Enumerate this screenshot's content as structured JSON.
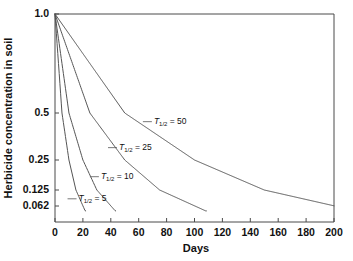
{
  "chart_data": {
    "type": "line",
    "title": "",
    "xlabel": "Days",
    "ylabel": "Herbicide concentration in soil",
    "xlim": [
      0,
      200
    ],
    "ylim": [
      0.0465,
      1.0
    ],
    "yscale": "half-life (power-compressed)",
    "grid": false,
    "legend_position": "inline-annotations",
    "xticks": [
      0,
      20,
      40,
      60,
      80,
      100,
      120,
      140,
      160,
      180,
      200
    ],
    "xtick_labels": [
      "0",
      "20",
      "40",
      "60",
      "80",
      "100",
      "120",
      "140",
      "160",
      "180",
      "200"
    ],
    "yticks": [
      1.0,
      0.5,
      0.25,
      0.125,
      0.062
    ],
    "ytick_labels": [
      "1.0",
      "0.5",
      "0.25",
      "0.125",
      "0.062"
    ],
    "series": [
      {
        "name": "T1/2 = 5",
        "half_life": 5,
        "label_prefix": "T",
        "label_sub": "1/2",
        "label_suffix": " = 5",
        "x": [
          0,
          5,
          10,
          15,
          20,
          25,
          30,
          35,
          40
        ],
        "values": [
          1.0,
          0.5,
          0.25,
          0.125,
          0.0625,
          0.03125,
          0.015625,
          0.0078125,
          0.00390625
        ]
      },
      {
        "name": "T1/2 = 10",
        "half_life": 10,
        "label_prefix": "T",
        "label_sub": "1/2",
        "label_suffix": " = 10",
        "x": [
          0,
          10,
          20,
          30,
          40,
          50,
          60,
          70,
          80
        ],
        "values": [
          1.0,
          0.5,
          0.25,
          0.125,
          0.0625,
          0.03125,
          0.015625,
          0.0078125,
          0.00390625
        ]
      },
      {
        "name": "T1/2 = 25",
        "half_life": 25,
        "label_prefix": "T",
        "label_sub": "1/2",
        "label_suffix": " = 25",
        "x": [
          0,
          25,
          50,
          75,
          100,
          125,
          150,
          175,
          200
        ],
        "values": [
          1.0,
          0.5,
          0.25,
          0.125,
          0.0625,
          0.03125,
          0.015625,
          0.0078125,
          0.00390625
        ]
      },
      {
        "name": "T1/2 = 50",
        "half_life": 50,
        "label_prefix": "T",
        "label_sub": "1/2",
        "label_suffix": " = 50",
        "x": [
          0,
          50,
          100,
          150,
          200
        ],
        "values": [
          1.0,
          0.5,
          0.25,
          0.125,
          0.0625
        ]
      }
    ],
    "annotations": [
      {
        "text": "T1/2 = 50",
        "at_x": 63,
        "at_y": 0.44
      },
      {
        "text": "T1/2 = 25",
        "at_x": 38,
        "at_y": 0.3
      },
      {
        "text": "T1/2 = 10",
        "at_x": 25,
        "at_y": 0.17
      },
      {
        "text": "T1/2 = 5",
        "at_x": 9,
        "at_y": 0.085
      }
    ]
  },
  "axis": {
    "x_title": "Days",
    "y_title": "Herbicide concentration in soil"
  },
  "colors": {
    "curve": "#555555",
    "axis": "#4a4a4a",
    "text": "#111111",
    "background": "#ffffff"
  }
}
